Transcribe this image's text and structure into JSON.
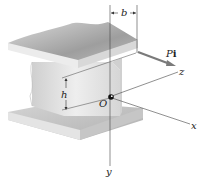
{
  "figure": {
    "labels": {
      "b": "b",
      "h": "h",
      "force_P": "P",
      "force_i": "i",
      "origin": "O",
      "x_axis": "x",
      "y_axis": "y",
      "z_axis": "z"
    },
    "colors": {
      "flange_top": "#c9c9c9",
      "flange_edge": "#e6e6e6",
      "web": "#dcdcdc",
      "line": "#444444",
      "arrow": "#7a7a7a"
    }
  }
}
